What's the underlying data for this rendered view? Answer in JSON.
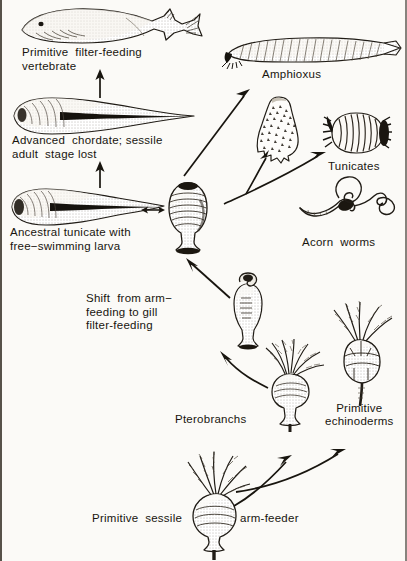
{
  "figure": {
    "domain": "diagram",
    "kind": "evolutionary-phylogeny-schematic",
    "background_color": "#fbfaf7",
    "ink_color": "#18150f"
  },
  "labels": {
    "primitive_vertebrate": "Primitive  filter-feeding\nvertebrate",
    "advanced_chordate": "Advanced  chordate; sessile\nadult  stage lost",
    "ancestral_tunicate": "Ancestral tunicate with\nfree−swimming larva",
    "shift_note": "Shift  from arm−\nfeeding to gill\nfilter-feeding",
    "amphioxus": "Amphioxus",
    "tunicates": "Tunicates",
    "acorn_worms": "Acorn  worms",
    "pterobranchs": "Pterobranchs",
    "primitive_echinoderms": "Primitive\nechinoderms",
    "arm_feeder_left": "Primitive  sessile",
    "arm_feeder_right": "arm-feeder"
  },
  "organisms": [
    {
      "id": "primitive-vertebrate",
      "label_key": "primitive_vertebrate",
      "x": 18,
      "y": 8
    },
    {
      "id": "advanced-chordate-larva",
      "label_key": "advanced_chordate",
      "x": 10,
      "y": 98
    },
    {
      "id": "ancestral-tunicate-larva",
      "label_key": "ancestral_tunicate",
      "x": 8,
      "y": 188
    },
    {
      "id": "adult-tunicate-stalked",
      "label_key": null,
      "x": 163,
      "y": 182
    },
    {
      "id": "amphioxus",
      "label_key": "amphioxus",
      "x": 222,
      "y": 36
    },
    {
      "id": "larval-tunicate-tadpole",
      "label_key": null,
      "x": 258,
      "y": 98
    },
    {
      "id": "tunicate-barrel",
      "label_key": "tunicates",
      "x": 322,
      "y": 112
    },
    {
      "id": "acorn-worm",
      "label_key": "acorn_worms",
      "x": 298,
      "y": 178
    },
    {
      "id": "transitional-pterobranch",
      "label_key": null,
      "x": 228,
      "y": 276
    },
    {
      "id": "pterobranch-stalked",
      "label_key": "pterobranchs",
      "x": 262,
      "y": 340
    },
    {
      "id": "primitive-echinoderm",
      "label_key": "primitive_echinoderms",
      "x": 330,
      "y": 302
    },
    {
      "id": "primitive-arm-feeder",
      "label_key": "arm_feeder_left",
      "x": 182,
      "y": 452
    }
  ],
  "arrows": [
    {
      "id": "arrow-chordate-to-vertebrate",
      "type": "straight-up",
      "from": "advanced-chordate-larva",
      "to": "primitive-vertebrate"
    },
    {
      "id": "arrow-tunicate-to-chordate",
      "type": "straight-up",
      "from": "ancestral-tunicate-larva",
      "to": "advanced-chordate-larva"
    },
    {
      "id": "arrow-larva-adult-reversible",
      "type": "double-headed-horizontal",
      "from": "ancestral-tunicate-larva",
      "to": "adult-tunicate-stalked"
    },
    {
      "id": "arrow-tunicate-to-amphioxus",
      "type": "diagonal-up-right",
      "from": "adult-tunicate-stalked",
      "to": "amphioxus"
    },
    {
      "id": "arrow-branching-to-tunicates",
      "type": "forked-diagonal",
      "from": "adult-tunicate-stalked",
      "to": "larval-tunicate-tadpole, tunicate-barrel"
    },
    {
      "id": "arrow-pterobranch-to-tunicate",
      "type": "diagonal-up-left",
      "from": "transitional-pterobranch",
      "to": "adult-tunicate-stalked"
    },
    {
      "id": "arrow-pterobranch-stalked-to-transitional",
      "type": "diagonal-up-left",
      "from": "pterobranch-stalked",
      "to": "transitional-pterobranch"
    },
    {
      "id": "arrow-armfeeder-to-pterobranch",
      "type": "diagonal-up-right",
      "from": "primitive-arm-feeder",
      "to": "pterobranch-stalked"
    },
    {
      "id": "arrow-armfeeder-to-echinoderm",
      "type": "diagonal-up-right",
      "from": "primitive-arm-feeder",
      "to": "primitive-echinoderm"
    }
  ],
  "bleed_through": {
    "line": "          "
  }
}
